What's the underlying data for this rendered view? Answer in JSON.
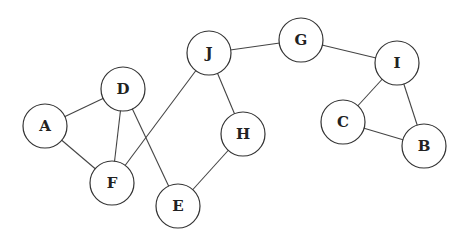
{
  "graph": {
    "nodes": [
      {
        "id": "A",
        "label": "A",
        "x": 45,
        "y": 126
      },
      {
        "id": "D",
        "label": "D",
        "x": 123,
        "y": 89
      },
      {
        "id": "F",
        "label": "F",
        "x": 112,
        "y": 183
      },
      {
        "id": "E",
        "label": "E",
        "x": 178,
        "y": 206
      },
      {
        "id": "J",
        "label": "J",
        "x": 209,
        "y": 53
      },
      {
        "id": "H",
        "label": "H",
        "x": 243,
        "y": 134
      },
      {
        "id": "G",
        "label": "G",
        "x": 301,
        "y": 40
      },
      {
        "id": "I",
        "label": "I",
        "x": 397,
        "y": 63
      },
      {
        "id": "C",
        "label": "C",
        "x": 343,
        "y": 122
      },
      {
        "id": "B",
        "label": "B",
        "x": 424,
        "y": 146
      }
    ],
    "edges": [
      [
        "A",
        "D"
      ],
      [
        "A",
        "F"
      ],
      [
        "D",
        "F"
      ],
      [
        "D",
        "E"
      ],
      [
        "F",
        "J"
      ],
      [
        "J",
        "G"
      ],
      [
        "J",
        "H"
      ],
      [
        "H",
        "E"
      ],
      [
        "G",
        "I"
      ],
      [
        "I",
        "C"
      ],
      [
        "I",
        "B"
      ],
      [
        "C",
        "B"
      ]
    ],
    "radius": 22
  }
}
